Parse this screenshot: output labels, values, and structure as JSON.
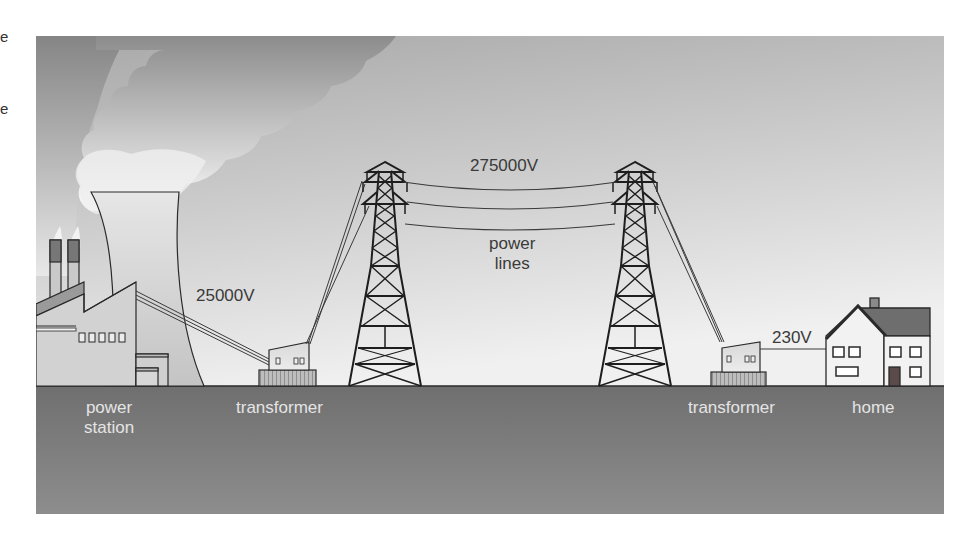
{
  "margin_fragments": [
    "e",
    "e"
  ],
  "colors": {
    "sky_top": "#9a9a9a",
    "sky_bottom": "#ececec",
    "smoke_dark": "#8a8a8a",
    "smoke_light": "#f4f4f4",
    "ground": "#7a7a7a",
    "line": "#2a2a2a",
    "roof": "#6e6e6e",
    "door": "#5a4a4a"
  },
  "diagram": {
    "voltages": {
      "generation": "25000V",
      "transmission": "275000V",
      "domestic": "230V"
    },
    "labels": {
      "power_station_line1": "power",
      "power_station_line2": "station",
      "transformer_step_up": "transformer",
      "power_lines_line1": "power",
      "power_lines_line2": "lines",
      "transformer_step_down": "transformer",
      "home": "home"
    },
    "components": [
      {
        "name": "power station",
        "role": "generates electricity at 25000V"
      },
      {
        "name": "transformer",
        "role": "steps voltage up to 275000V"
      },
      {
        "name": "pylon",
        "count": 2
      },
      {
        "name": "power lines",
        "voltage": "275000V"
      },
      {
        "name": "transformer",
        "role": "steps voltage down to 230V"
      },
      {
        "name": "home",
        "voltage": "230V"
      }
    ]
  }
}
